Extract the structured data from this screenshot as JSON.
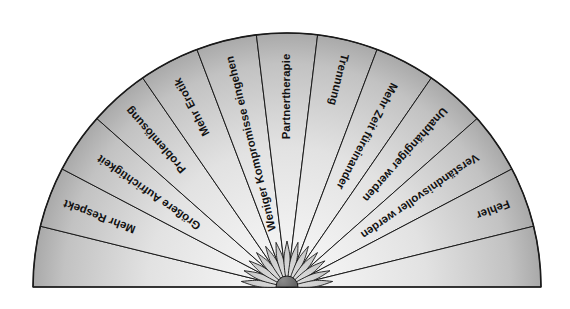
{
  "diagram": {
    "type": "semicircular-fan",
    "geometry": {
      "center_x": 287,
      "center_y": 287,
      "outer_radius": 254,
      "hub_radius": 11,
      "petal_outer_radius": 46,
      "start_angle_deg": 180,
      "end_angle_deg": 0
    },
    "colors": {
      "wedge_fill_outer": "#b4b4b4",
      "wedge_fill_inner": "#f2f2f2",
      "petal_fill": "#cfcfcf",
      "hub_fill": "#6e6e6e",
      "outline": "#1a1a1a",
      "background": "#ffffff",
      "label_text": "#111111"
    },
    "segments": [
      {
        "id": "seg-bottom-left",
        "label": "",
        "labeled": false
      },
      {
        "id": "seg-mehr-respekt",
        "label": "Mehr Respekt",
        "labeled": true
      },
      {
        "id": "seg-groessere-aufrichtigkeit",
        "label": "Größere Aufrichtigkeit",
        "labeled": true
      },
      {
        "id": "seg-problemloesung",
        "label": "Problemlösung",
        "labeled": true
      },
      {
        "id": "seg-mehr-erotik",
        "label": "Mehr Erotik",
        "labeled": true
      },
      {
        "id": "seg-weniger-kompromisse",
        "label": "Weniger Kompromisse eingehen",
        "labeled": true
      },
      {
        "id": "seg-partnertherapie",
        "label": "Partnertherapie",
        "labeled": true
      },
      {
        "id": "seg-trennung",
        "label": "Trennung",
        "labeled": true
      },
      {
        "id": "seg-mehr-zeit",
        "label": "Mehr Zeit füreinander",
        "labeled": true
      },
      {
        "id": "seg-unabhaengiger",
        "label": "Unabhängiger werden",
        "labeled": true
      },
      {
        "id": "seg-verstaendnisvoller",
        "label": "Verständnisvoller werden",
        "labeled": true
      },
      {
        "id": "seg-fehler",
        "label": "Fehler",
        "labeled": true
      },
      {
        "id": "seg-bottom-right",
        "label": "",
        "labeled": false
      }
    ]
  }
}
